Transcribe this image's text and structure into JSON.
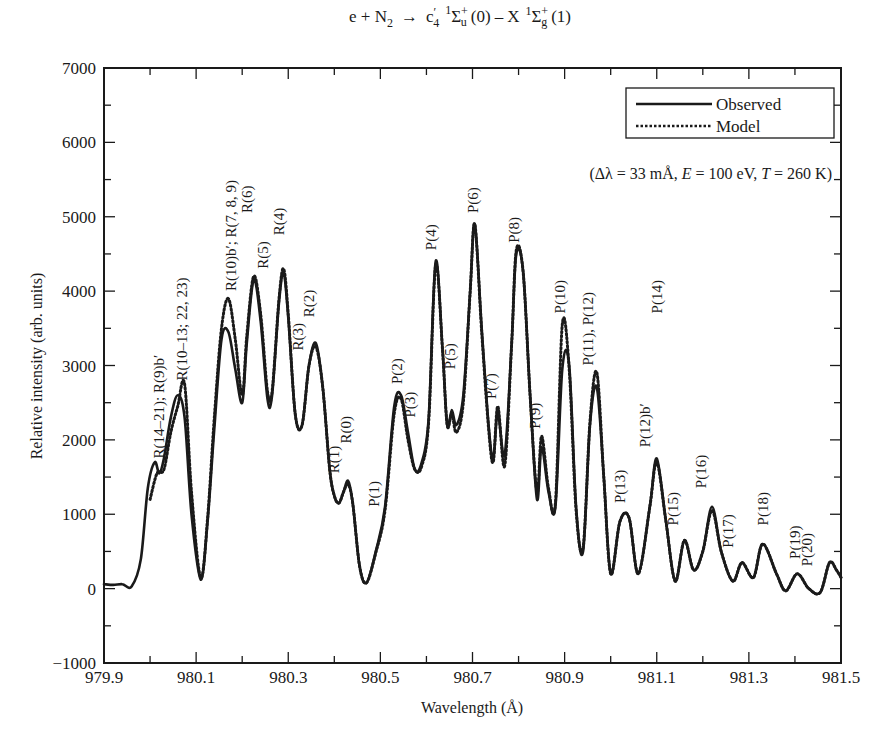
{
  "chart_data": {
    "type": "line",
    "title_parts": {
      "lhs": "e + N",
      "lhs_sub": "2",
      "arrow": "→",
      "upper": "c",
      "upper_prime": "′",
      "upper_sub": "4",
      "upper_mult": "1",
      "sigma": "Σ",
      "upper_sym_sup": "+",
      "upper_sym_sub": "u",
      "upper_v": "(0)",
      "dash": "–",
      "lower": "X",
      "lower_mult": "1",
      "lower_sym_sup": "+",
      "lower_sym_sub": "g",
      "lower_v": "(1)"
    },
    "xlabel": "Wavelength (Å)",
    "ylabel": "Relative intensity (arb. units)",
    "xlim": [
      979.9,
      981.5
    ],
    "ylim": [
      -1000,
      7000
    ],
    "x_ticks": [
      979.9,
      980.1,
      980.3,
      980.5,
      980.7,
      980.9,
      981.1,
      981.3,
      981.5
    ],
    "x_tick_labels": [
      "979.9",
      "980.1",
      "980.3",
      "980.5",
      "980.7",
      "980.9",
      "981.1",
      "981.3",
      "981.5"
    ],
    "x_minor_step": 0.1,
    "y_ticks": [
      -1000,
      0,
      1000,
      2000,
      3000,
      4000,
      5000,
      6000,
      7000
    ],
    "y_tick_labels": [
      "−1000",
      "0",
      "1000",
      "2000",
      "3000",
      "4000",
      "5000",
      "6000",
      "7000"
    ],
    "y_minor_step": 500,
    "grid": false,
    "legend": {
      "position": "upper right",
      "entries": [
        {
          "name": "Observed",
          "style": "solid"
        },
        {
          "name": "Model",
          "style": "dotted"
        }
      ]
    },
    "annotation": "(Δλ = 33 mÅ, E = 100 eV, T = 260 K)",
    "annotation_parts": [
      "(Δλ = 33 mÅ, ",
      "E",
      " = 100 eV, ",
      "T",
      " = 260 K)"
    ],
    "series": [
      {
        "name": "Observed",
        "style": "solid",
        "x": [
          979.9,
          979.92,
          979.94,
          979.96,
          979.98,
          979.995,
          980.01,
          980.02,
          980.03,
          980.045,
          980.06,
          980.075,
          980.09,
          980.11,
          980.125,
          980.14,
          980.155,
          980.17,
          980.185,
          980.2,
          980.21,
          980.225,
          980.24,
          980.255,
          980.265,
          980.28,
          980.29,
          980.3,
          980.315,
          980.33,
          980.345,
          980.36,
          980.375,
          980.39,
          980.4,
          980.41,
          980.42,
          980.43,
          980.44,
          980.455,
          980.47,
          980.49,
          980.51,
          980.53,
          980.545,
          980.56,
          980.575,
          980.59,
          980.605,
          980.62,
          980.635,
          980.645,
          980.655,
          980.665,
          980.68,
          980.695,
          980.705,
          980.72,
          980.735,
          980.745,
          980.755,
          980.77,
          980.785,
          980.795,
          980.81,
          980.825,
          980.84,
          980.85,
          980.865,
          980.88,
          980.895,
          980.91,
          980.925,
          980.94,
          980.955,
          980.97,
          980.985,
          981.0,
          981.02,
          981.04,
          981.06,
          981.085,
          981.1,
          981.12,
          981.14,
          981.16,
          981.18,
          981.2,
          981.22,
          981.24,
          981.265,
          981.285,
          981.31,
          981.33,
          981.36,
          981.38,
          981.405,
          981.43,
          981.455,
          981.475,
          981.49,
          981.5
        ],
        "y": [
          60,
          50,
          60,
          30,
          400,
          1350,
          1700,
          1550,
          1750,
          2300,
          2600,
          2300,
          1000,
          120,
          900,
          2200,
          3350,
          3450,
          2950,
          2500,
          3300,
          4150,
          3600,
          2550,
          2600,
          3850,
          4250,
          3650,
          2350,
          2200,
          3000,
          3300,
          2700,
          1600,
          1250,
          1150,
          1300,
          1450,
          1150,
          300,
          80,
          500,
          1100,
          2450,
          2600,
          2100,
          1600,
          1700,
          2300,
          4400,
          3200,
          2200,
          2400,
          2200,
          2600,
          4000,
          4900,
          3500,
          2200,
          1750,
          2350,
          1800,
          3300,
          4500,
          4250,
          2600,
          1200,
          1900,
          1300,
          1100,
          2950,
          3000,
          1100,
          500,
          2200,
          2700,
          1500,
          200,
          900,
          950,
          200,
          1100,
          1750,
          900,
          100,
          650,
          250,
          500,
          1100,
          500,
          100,
          350,
          150,
          600,
          200,
          -30,
          200,
          0,
          -50,
          350,
          250,
          150
        ]
      },
      {
        "name": "Model",
        "style": "dotted",
        "x": [
          980.0,
          980.015,
          980.03,
          980.045,
          980.06,
          980.075,
          980.09,
          980.11,
          980.125,
          980.14,
          980.155,
          980.17,
          980.185,
          980.2,
          980.21,
          980.225,
          980.24,
          980.255,
          980.265,
          980.28,
          980.29,
          980.3,
          980.315,
          980.33,
          980.345,
          980.36,
          980.375,
          980.39,
          980.4,
          980.41,
          980.42,
          980.43,
          980.44,
          980.455,
          980.47,
          980.49,
          980.51,
          980.53,
          980.545,
          980.56,
          980.575,
          980.59,
          980.605,
          980.62,
          980.635,
          980.645,
          980.655,
          980.665,
          980.68,
          980.695,
          980.705,
          980.72,
          980.735,
          980.745,
          980.755,
          980.77,
          980.785,
          980.795,
          980.81,
          980.825,
          980.84,
          980.85,
          980.865,
          980.88,
          980.895,
          980.91,
          980.925,
          980.94,
          980.955,
          980.97,
          980.985,
          981.0,
          981.02,
          981.04,
          981.06,
          981.085,
          981.1,
          981.12,
          981.14,
          981.16,
          981.18,
          981.2,
          981.22,
          981.24,
          981.265,
          981.285,
          981.31,
          981.33,
          981.36,
          981.38,
          981.405,
          981.43,
          981.455,
          981.475,
          981.49,
          981.5
        ],
        "y": [
          1200,
          1550,
          1600,
          2100,
          2450,
          2750,
          1300,
          150,
          950,
          2350,
          3500,
          3900,
          3350,
          2600,
          3400,
          4200,
          3700,
          2650,
          2650,
          3900,
          4300,
          3700,
          2350,
          2200,
          3000,
          3250,
          2700,
          1600,
          1250,
          1150,
          1300,
          1400,
          1150,
          300,
          80,
          480,
          1050,
          2350,
          2550,
          2000,
          1600,
          1650,
          2250,
          4350,
          3200,
          2200,
          2350,
          2100,
          2500,
          4000,
          4900,
          3450,
          2150,
          1700,
          2450,
          1650,
          3300,
          4550,
          4250,
          2600,
          1300,
          2050,
          1350,
          1150,
          3550,
          2950,
          1050,
          550,
          2250,
          2900,
          1500,
          200,
          900,
          950,
          200,
          1100,
          1700,
          900,
          100,
          650,
          250,
          500,
          1050,
          500,
          100,
          350,
          150,
          600,
          200,
          -30,
          200,
          0,
          -50,
          350,
          250,
          150
        ]
      }
    ],
    "peak_labels": [
      {
        "text": "R(14–21); R(9)b′",
        "x": 980.02,
        "y": 1750
      },
      {
        "text": "R(10–13; 22, 23)",
        "x": 980.07,
        "y": 2800
      },
      {
        "text": "R(10)b′; R(7, 8, 9)",
        "x": 980.175,
        "y": 4000
      },
      {
        "text": "R(6)",
        "x": 980.21,
        "y": 5050
      },
      {
        "text": "R(5)",
        "x": 980.245,
        "y": 4300
      },
      {
        "text": "R(4)",
        "x": 980.28,
        "y": 4750
      },
      {
        "text": "R(3)",
        "x": 980.32,
        "y": 3200
      },
      {
        "text": "R(2)",
        "x": 980.345,
        "y": 3650
      },
      {
        "text": "R(1)",
        "x": 980.4,
        "y": 1550
      },
      {
        "text": "R(0)",
        "x": 980.425,
        "y": 1950
      },
      {
        "text": "P(1)",
        "x": 980.485,
        "y": 1100
      },
      {
        "text": "P(2)",
        "x": 980.535,
        "y": 2750
      },
      {
        "text": "P(3)",
        "x": 980.565,
        "y": 2300
      },
      {
        "text": "P(4)",
        "x": 980.61,
        "y": 4550
      },
      {
        "text": "P(5)",
        "x": 980.65,
        "y": 2950
      },
      {
        "text": "P(6)",
        "x": 980.7,
        "y": 5050
      },
      {
        "text": "P(7)",
        "x": 980.74,
        "y": 2550
      },
      {
        "text": "P(8)",
        "x": 980.79,
        "y": 4650
      },
      {
        "text": "P(9)",
        "x": 980.835,
        "y": 2150
      },
      {
        "text": "P(10)",
        "x": 980.89,
        "y": 3700
      },
      {
        "text": "P(11), P(12)",
        "x": 980.95,
        "y": 3000
      },
      {
        "text": "P(12)b′",
        "x": 981.075,
        "y": 1900
      },
      {
        "text": "P(14)",
        "x": 981.1,
        "y": 3700
      },
      {
        "text": "P(13)",
        "x": 981.02,
        "y": 1150
      },
      {
        "text": "P(15)",
        "x": 981.135,
        "y": 850
      },
      {
        "text": "P(16)",
        "x": 981.195,
        "y": 1350
      },
      {
        "text": "P(17)",
        "x": 981.255,
        "y": 550
      },
      {
        "text": "P(18)",
        "x": 981.33,
        "y": 850
      },
      {
        "text": "P(19)",
        "x": 981.4,
        "y": 400
      },
      {
        "text": "P(20)",
        "x": 981.425,
        "y": 300
      }
    ]
  },
  "style": {
    "line_color": "#1a1a1a",
    "axis_color": "#1a1a1a",
    "background": "#ffffff"
  }
}
